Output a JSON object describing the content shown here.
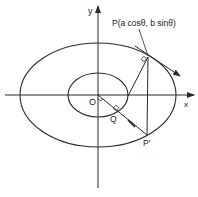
{
  "diagram": {
    "type": "ellipse-eccentric-angle",
    "colors": {
      "stroke": "#2a2a2a",
      "background": "#ffffff",
      "text": "#222222"
    },
    "labels": {
      "y_axis": "y",
      "x_axis": "x",
      "origin": "O",
      "point_p": "P(a cosθ, b sinθ)",
      "point_q": "Q",
      "point_p_prime": "P'"
    },
    "geometry": {
      "origin": [
        98,
        95
      ],
      "outer_ellipse": {
        "rx": 78,
        "ry": 52
      },
      "inner_ellipse": {
        "rx": 30,
        "ry": 22
      },
      "P": [
        148,
        57
      ],
      "P_prime": [
        147,
        135
      ],
      "Q": [
        117,
        114
      ]
    }
  }
}
